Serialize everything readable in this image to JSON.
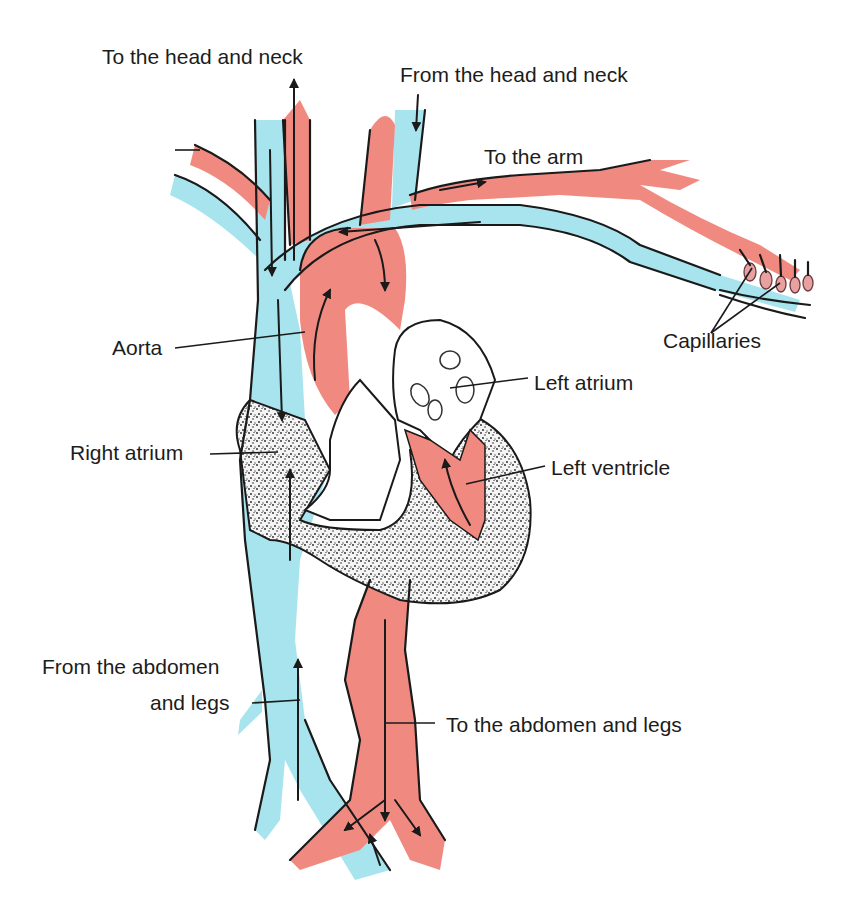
{
  "diagram": {
    "colors": {
      "oxygenated": "#f08a80",
      "deoxygenated": "#a8e4ee",
      "muscle": "#e8e8e8",
      "outline": "#1a1a1a",
      "background": "#ffffff"
    },
    "labels": {
      "to_head_neck": "To the head and neck",
      "from_head_neck": "From the head and neck",
      "to_arm": "To the arm",
      "capillaries": "Capillaries",
      "aorta": "Aorta",
      "left_atrium": "Left atrium",
      "right_atrium": "Right atrium",
      "left_ventricle": "Left ventricle",
      "from_abdomen_line1": "From the abdomen",
      "from_abdomen_line2": "and legs",
      "to_abdomen_legs": "To the abdomen and legs"
    }
  }
}
